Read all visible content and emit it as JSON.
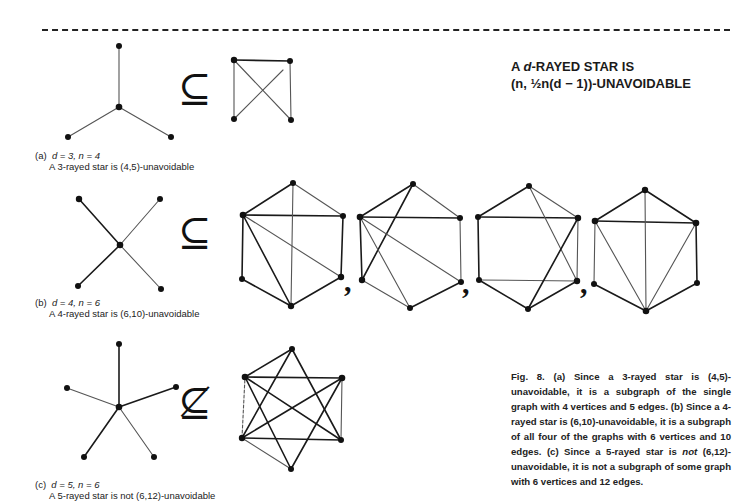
{
  "headline": {
    "line1_prefix": "A ",
    "line1_var": "d",
    "line1_suffix": "-RAYED STAR IS",
    "line2": "(n, ½n(d − 1))-UNAVOIDABLE"
  },
  "panels": [
    {
      "label": "(a)",
      "params": "d = 3, n = 4",
      "statement": "A 3-rayed star is (4,5)-unavoidable",
      "relation": "⊆",
      "relation_name": "subset-or-equal"
    },
    {
      "label": "(b)",
      "params": "d = 4, n = 6",
      "statement": "A 4-rayed star is (6,10)-unavoidable",
      "relation": "⊆",
      "relation_name": "subset-or-equal"
    },
    {
      "label": "(c)",
      "params": "d = 5, n = 6",
      "statement": "A 5-rayed star is not (6,12)-unavoidable",
      "relation": "⊈",
      "relation_name": "not-subset"
    }
  ],
  "figure_caption": {
    "part1": "Fig. 8. (a) Since a 3-rayed star is (4,5)-unavoidable, it is a subgraph of the single graph with 4 vertices and 5 edges. (b) Since a 4-rayed star is (6,10)-unavoidable, it is a subgraph of all four of the graphs with 6 vertices and 10 edges. (c) Since a 5-rayed star is ",
    "emphasis": "not",
    "part2": " (6,12)-unavoidable, it is not a subgraph of some graph with 6 vertices and 12 edges."
  },
  "graphs": {
    "star_a": {
      "center": [
        119,
        107
      ],
      "leaves": [
        [
          119,
          46
        ],
        [
          68,
          137
        ],
        [
          171,
          137
        ]
      ]
    },
    "star_b": {
      "center": [
        120,
        245
      ],
      "leaves": [
        [
          79,
          199
        ],
        [
          160,
          199
        ],
        [
          78,
          286
        ],
        [
          161,
          289
        ]
      ]
    },
    "star_c": {
      "center": [
        119,
        407
      ],
      "leaves": [
        [
          119,
          344
        ],
        [
          67,
          388
        ],
        [
          176,
          387
        ],
        [
          84,
          457
        ],
        [
          154,
          457
        ]
      ]
    },
    "graph_a": {
      "vertices": 4,
      "edges": 5
    },
    "graphs_b": [
      {
        "vertices": 6,
        "edges": 10
      },
      {
        "vertices": 6,
        "edges": 10
      },
      {
        "vertices": 6,
        "edges": 10
      },
      {
        "vertices": 6,
        "edges": 10
      }
    ],
    "graph_c": {
      "vertices": 6,
      "edges": 12
    }
  }
}
